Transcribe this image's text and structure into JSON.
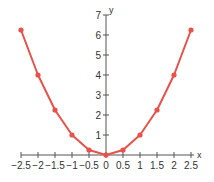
{
  "chart_data": {
    "type": "line",
    "title": "",
    "xlabel": "x",
    "ylabel": "y",
    "x": [
      -2.5,
      -2,
      -1.5,
      -1,
      -0.5,
      0,
      0.5,
      1,
      1.5,
      2,
      2.5
    ],
    "series": [
      {
        "name": "y = x^2",
        "values": [
          6.25,
          4,
          2.25,
          1,
          0.25,
          0,
          0.25,
          1,
          2.25,
          4,
          6.25
        ],
        "color": "#e8524a",
        "markers": true
      }
    ],
    "xlim": [
      -2.5,
      2.5
    ],
    "ylim": [
      0,
      7
    ],
    "x_ticks": [
      -2.5,
      -2,
      -1.5,
      -1,
      -0.5,
      0,
      0.5,
      1,
      1.5,
      2,
      2.5
    ],
    "x_tick_labels": [
      "-2.5",
      "-2",
      "-1.5",
      "-1",
      "-0.5",
      "0",
      "0.5",
      "1",
      "1.5",
      "2",
      "2.5"
    ],
    "y_ticks": [
      1,
      2,
      3,
      4,
      5,
      6,
      7
    ],
    "y_tick_labels": [
      "1",
      "2",
      "3",
      "4",
      "5",
      "6",
      "7"
    ],
    "grid": false,
    "legend": "none",
    "axis_color": "#555555"
  }
}
